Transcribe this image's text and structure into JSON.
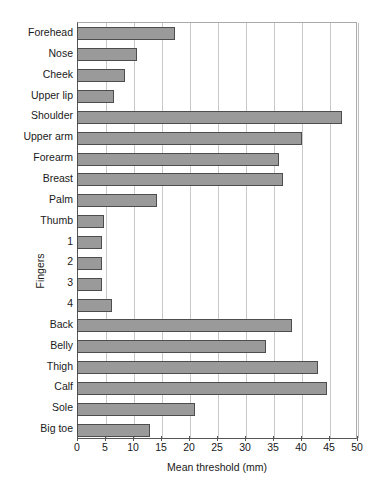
{
  "chart_data": {
    "type": "bar",
    "orientation": "horizontal",
    "title": "",
    "xlabel": "Mean threshold (mm)",
    "ylabel": "",
    "xlim": [
      0,
      50
    ],
    "xticks": [
      0,
      5,
      10,
      15,
      20,
      25,
      30,
      35,
      40,
      45,
      50
    ],
    "grid": true,
    "legend": false,
    "bar_color": "#9a9a9a",
    "bar_edge_color": "#4d4d4d",
    "group_labels": [
      {
        "text": "Fingers",
        "members": [
          "1",
          "2",
          "3",
          "4"
        ]
      }
    ],
    "categories": [
      "Forehead",
      "Nose",
      "Cheek",
      "Upper lip",
      "Shoulder",
      "Upper arm",
      "Forearm",
      "Breast",
      "Palm",
      "Thumb",
      "1",
      "2",
      "3",
      "4",
      "Back",
      "Belly",
      "Thigh",
      "Calf",
      "Sole",
      "Big toe"
    ],
    "values": [
      17.5,
      10.7,
      8.6,
      6.6,
      47.4,
      40.2,
      36.0,
      36.8,
      14.3,
      4.8,
      4.5,
      4.5,
      4.5,
      6.2,
      38.4,
      33.8,
      43.0,
      44.6,
      21.0,
      13.1
    ]
  }
}
